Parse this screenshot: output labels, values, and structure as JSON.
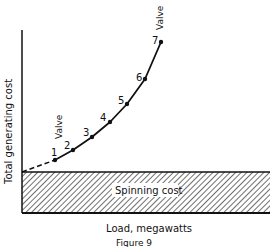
{
  "figure": {
    "caption": "Figure 9",
    "x_axis_label": "Load, megawatts",
    "y_axis_label": "Total generating cost",
    "band_label": "Spinning cost",
    "annotations": [
      {
        "text": "Valve",
        "near_point": 1
      },
      {
        "text": "Valve",
        "near_point": 7
      }
    ],
    "points": [
      {
        "label": "1",
        "x": 55,
        "y": 160
      },
      {
        "label": "2",
        "x": 73,
        "y": 150
      },
      {
        "label": "3",
        "x": 92,
        "y": 137
      },
      {
        "label": "4",
        "x": 110,
        "y": 122
      },
      {
        "label": "5",
        "x": 127,
        "y": 104
      },
      {
        "label": "6",
        "x": 145,
        "y": 79
      },
      {
        "label": "7",
        "x": 161,
        "y": 42
      }
    ],
    "colors": {
      "ink": "#111111",
      "background": "#ffffff"
    }
  }
}
